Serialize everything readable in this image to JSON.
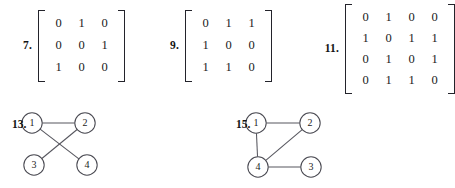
{
  "page": {
    "background_color": "#ffffff",
    "ink_color": "#1b1b1b"
  },
  "exercises": [
    {
      "number": "7.",
      "type": "matrix",
      "rows": 3,
      "cols": 3,
      "values": [
        [
          "0",
          "1",
          "0"
        ],
        [
          "0",
          "0",
          "1"
        ],
        [
          "1",
          "0",
          "0"
        ]
      ]
    },
    {
      "number": "9.",
      "type": "matrix",
      "rows": 3,
      "cols": 3,
      "values": [
        [
          "0",
          "1",
          "1"
        ],
        [
          "1",
          "0",
          "0"
        ],
        [
          "1",
          "1",
          "0"
        ]
      ]
    },
    {
      "number": "11.",
      "type": "matrix",
      "rows": 4,
      "cols": 4,
      "values": [
        [
          "0",
          "1",
          "0",
          "0"
        ],
        [
          "1",
          "0",
          "1",
          "1"
        ],
        [
          "0",
          "1",
          "0",
          "1"
        ],
        [
          "0",
          "1",
          "1",
          "0"
        ]
      ]
    },
    {
      "number": "13.",
      "type": "graph",
      "nodes": [
        {
          "label": "1",
          "x": 20,
          "y": 13
        },
        {
          "label": "2",
          "x": 73,
          "y": 13
        },
        {
          "label": "3",
          "x": 22,
          "y": 55
        },
        {
          "label": "4",
          "x": 75,
          "y": 55
        }
      ],
      "edges": [
        {
          "from": 0,
          "to": 1
        },
        {
          "from": 0,
          "to": 3
        },
        {
          "from": 1,
          "to": 2
        }
      ]
    },
    {
      "number": "15.",
      "type": "graph",
      "nodes": [
        {
          "label": "1",
          "x": 20,
          "y": 13
        },
        {
          "label": "2",
          "x": 74,
          "y": 13
        },
        {
          "label": "4",
          "x": 22,
          "y": 57
        },
        {
          "label": "3",
          "x": 75,
          "y": 57
        }
      ],
      "edges": [
        {
          "from": 0,
          "to": 1
        },
        {
          "from": 0,
          "to": 2
        },
        {
          "from": 1,
          "to": 2
        },
        {
          "from": 2,
          "to": 3
        }
      ]
    }
  ]
}
